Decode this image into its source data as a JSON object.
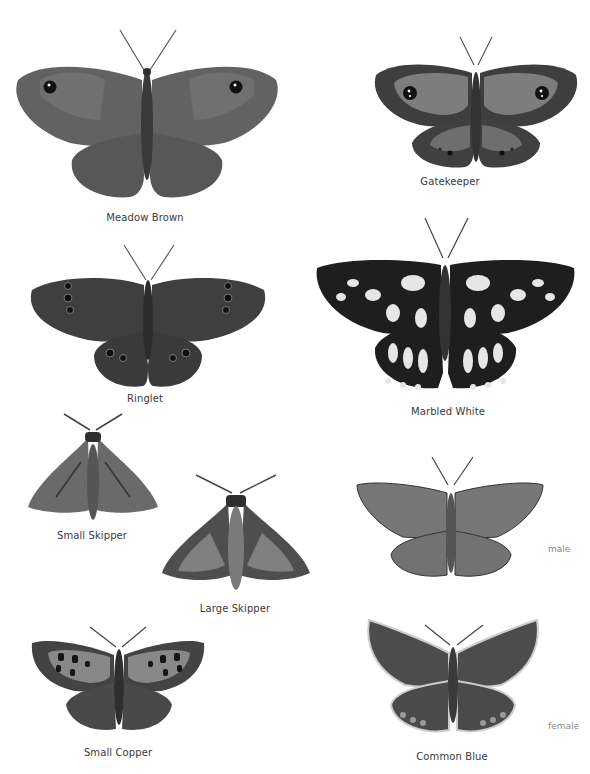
{
  "plate": {
    "specimens": [
      {
        "id": "meadow-brown",
        "name": "Meadow Brown"
      },
      {
        "id": "gatekeeper",
        "name": "Gatekeeper"
      },
      {
        "id": "ringlet",
        "name": "Ringlet"
      },
      {
        "id": "marbled-white",
        "name": "Marbled White"
      },
      {
        "id": "small-skipper",
        "name": "Small Skipper"
      },
      {
        "id": "large-skipper",
        "name": "Large Skipper"
      },
      {
        "id": "small-copper",
        "name": "Small Copper"
      },
      {
        "id": "common-blue",
        "name": "Common Blue",
        "sexes": [
          "male",
          "female"
        ]
      }
    ]
  },
  "colors": {
    "background": "#ffffff",
    "wing_mid": "#5e5e5e",
    "wing_dark": "#3c3c3c",
    "wing_light": "#8a8a8a",
    "caption": "#3a3a3a",
    "sex_label": "#8a8a8a"
  }
}
